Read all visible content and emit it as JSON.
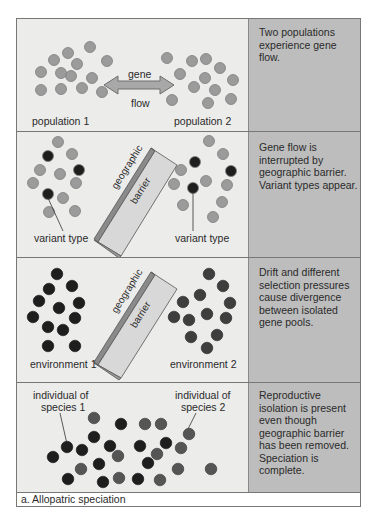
{
  "colors": {
    "panel_bg": "#ececea",
    "description_bg": "#bdbdbd",
    "dot_light": "#9b9b9b",
    "dot_medium": "#5a5a5a",
    "dot_dark": "#1e1e1e",
    "barrier_face": "#d8d8d8",
    "arrow": "#a8a8a8"
  },
  "panels": [
    {
      "id": "gene-flow",
      "labels": {
        "left": "population 1",
        "right": "population 2",
        "arrow_top": "gene",
        "arrow_bottom": "flow"
      },
      "description": "Two populations experience gene flow."
    },
    {
      "id": "barrier",
      "labels": {
        "left": "variant type",
        "right": "variant type",
        "barrier_line1": "geographic",
        "barrier_line2": "barrier"
      },
      "description": "Gene flow is interrupted by geographic barrier.  Variant types appear."
    },
    {
      "id": "divergence",
      "labels": {
        "left": "environment 1",
        "right": "environment 2",
        "barrier_line1": "geographic",
        "barrier_line2": "barrier"
      },
      "description": "Drift and different selection pressures cause divergence between isolated gene pools."
    },
    {
      "id": "reproductive-isolation",
      "labels": {
        "left_line1": "individual of",
        "left_line2": "species 1",
        "right_line1": "individual of",
        "right_line2": "species 2"
      },
      "description": "Reproductive isolation is present even though geographic barrier has been removed.  Speciation is complete."
    }
  ],
  "caption": "a. Allopatric speciation"
}
